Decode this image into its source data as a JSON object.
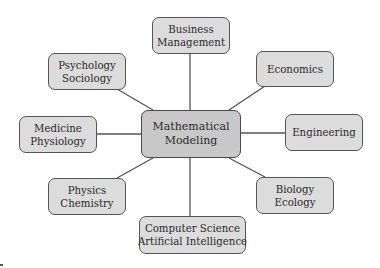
{
  "diagram": {
    "type": "mind-map",
    "colors": {
      "node_fill": "#dcdcdc",
      "center_fill": "#c8c8c8",
      "border": "#555555",
      "line": "#555555",
      "text": "#2a2a2a"
    },
    "center": {
      "id": "mathematical-modeling",
      "lines": [
        "Mathematical",
        "Modeling"
      ]
    },
    "nodes": [
      {
        "id": "business-management",
        "lines": [
          "Business",
          "Management"
        ]
      },
      {
        "id": "psychology-sociology",
        "lines": [
          "Psychology",
          "Sociology"
        ]
      },
      {
        "id": "economics",
        "lines": [
          "Economics"
        ]
      },
      {
        "id": "medicine-physiology",
        "lines": [
          "Medicine",
          "Physiology"
        ]
      },
      {
        "id": "engineering",
        "lines": [
          "Engineering"
        ]
      },
      {
        "id": "physics-chemistry",
        "lines": [
          "Physics",
          "Chemistry"
        ]
      },
      {
        "id": "biology-ecology",
        "lines": [
          "Biology",
          "Ecology"
        ]
      },
      {
        "id": "computer-science-ai",
        "lines": [
          "Computer Science",
          "Artificial Intelligence"
        ]
      }
    ],
    "edges": [
      {
        "from": "mathematical-modeling",
        "to": "business-management"
      },
      {
        "from": "mathematical-modeling",
        "to": "psychology-sociology"
      },
      {
        "from": "mathematical-modeling",
        "to": "economics"
      },
      {
        "from": "mathematical-modeling",
        "to": "medicine-physiology"
      },
      {
        "from": "mathematical-modeling",
        "to": "engineering"
      },
      {
        "from": "mathematical-modeling",
        "to": "physics-chemistry"
      },
      {
        "from": "mathematical-modeling",
        "to": "biology-ecology"
      },
      {
        "from": "mathematical-modeling",
        "to": "computer-science-ai"
      }
    ]
  }
}
